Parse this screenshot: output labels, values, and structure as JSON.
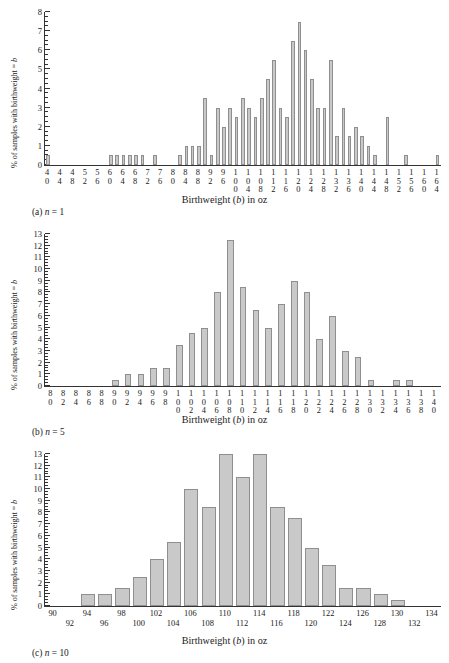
{
  "figure": {
    "axis_y_title_prefix": "% of samples with birthweight = ",
    "axis_y_title_var": "b",
    "axis_x_title_prefix": "Birthweight (",
    "axis_x_title_var": "b",
    "axis_x_title_suffix": ") in oz",
    "bar_fill": "#c9c9c9",
    "bar_stroke": "#8f8f8f",
    "axis_color": "#333333"
  },
  "panels": [
    {
      "id": "a",
      "caption_label": "(a)",
      "caption_var": "n",
      "caption_value": "= 1",
      "caption_full": "(a) n = 1"
    },
    {
      "id": "b",
      "caption_label": "(b)",
      "caption_var": "n",
      "caption_value": "= 5",
      "caption_full": "(b) n = 5"
    },
    {
      "id": "c",
      "caption_label": "(c)",
      "caption_var": "n",
      "caption_value": "= 10",
      "caption_full": "(c) n = 10"
    }
  ],
  "chart_data": [
    {
      "type": "bar",
      "panel": "a",
      "title": "(a) n = 1",
      "xlabel": "Birthweight (b) in oz",
      "ylabel": "% of samples with birthweight = b",
      "ylim": [
        0,
        8
      ],
      "yticks": [
        0,
        1,
        2,
        3,
        4,
        5,
        6,
        7,
        8
      ],
      "ytick_minor_step": 0.25,
      "grid": false,
      "legend": "none",
      "xtick_labels": [
        "40",
        "44",
        "48",
        "52",
        "56",
        "60",
        "64",
        "68",
        "72",
        "76",
        "80",
        "84",
        "88",
        "92",
        "96",
        "100",
        "104",
        "108",
        "112",
        "116",
        "120",
        "124",
        "128",
        "132",
        "136",
        "140",
        "144",
        "148",
        "152",
        "156",
        "160",
        "164"
      ],
      "xtick_every": 2,
      "categories": [
        40,
        42,
        44,
        46,
        48,
        50,
        52,
        54,
        56,
        58,
        60,
        62,
        64,
        66,
        68,
        70,
        72,
        74,
        76,
        78,
        80,
        82,
        84,
        86,
        88,
        90,
        92,
        94,
        96,
        98,
        100,
        102,
        104,
        106,
        108,
        110,
        112,
        114,
        116,
        118,
        120,
        122,
        124,
        126,
        128,
        130,
        132,
        134,
        136,
        138,
        140,
        142,
        144,
        146,
        148,
        150,
        152,
        154,
        156,
        158,
        160,
        162,
        164
      ],
      "values": [
        0.5,
        0,
        0,
        0,
        0,
        0,
        0,
        0,
        0,
        0,
        0.5,
        0.5,
        0.5,
        0.5,
        0.5,
        0.5,
        0,
        0.5,
        0,
        0,
        0,
        0.5,
        1.0,
        1.0,
        1.0,
        3.5,
        0.5,
        3.0,
        2.0,
        3.0,
        2.5,
        3.5,
        3.0,
        2.5,
        3.5,
        4.5,
        5.5,
        3.0,
        2.5,
        6.5,
        7.5,
        6.0,
        4.5,
        3.0,
        3.0,
        5.5,
        1.5,
        3.0,
        1.5,
        2.0,
        1.5,
        1.0,
        0.5,
        0,
        2.5,
        0,
        0,
        0.5,
        0,
        0,
        0,
        0,
        0.5
      ]
    },
    {
      "type": "bar",
      "panel": "b",
      "title": "(b) n = 5",
      "xlabel": "Birthweight (b) in oz",
      "ylabel": "% of samples with birthweight = b",
      "ylim": [
        0,
        13
      ],
      "yticks": [
        0,
        1,
        2,
        3,
        4,
        5,
        6,
        7,
        8,
        9,
        10,
        11,
        12,
        13
      ],
      "ytick_minor_step": 0.25,
      "grid": false,
      "legend": "none",
      "xtick_labels": [
        "80",
        "82",
        "84",
        "86",
        "88",
        "90",
        "92",
        "94",
        "96",
        "98",
        "100",
        "102",
        "104",
        "106",
        "108",
        "110",
        "112",
        "114",
        "116",
        "118",
        "120",
        "122",
        "124",
        "126",
        "128",
        "130",
        "132",
        "134",
        "136",
        "138",
        "140"
      ],
      "categories": [
        80,
        82,
        84,
        86,
        88,
        90,
        92,
        94,
        96,
        98,
        100,
        102,
        104,
        106,
        108,
        110,
        112,
        114,
        116,
        118,
        120,
        122,
        124,
        126,
        128,
        130,
        132,
        134,
        136,
        138,
        140
      ],
      "values": [
        0,
        0,
        0,
        0,
        0,
        0.5,
        1.0,
        1.0,
        1.5,
        1.5,
        3.5,
        4.5,
        5.0,
        8.0,
        12.5,
        8.5,
        6.5,
        5.0,
        7.0,
        9.0,
        8.0,
        4.0,
        6.0,
        3.0,
        2.5,
        0.5,
        0,
        0.5,
        0.5,
        0,
        0
      ]
    },
    {
      "type": "bar",
      "panel": "c",
      "title": "(c) n = 10",
      "xlabel": "Birthweight (b) in oz",
      "ylabel": "% of samples with birthweight = b",
      "ylim": [
        0,
        13
      ],
      "yticks": [
        0,
        1,
        2,
        3,
        4,
        5,
        6,
        7,
        8,
        9,
        10,
        11,
        12,
        13
      ],
      "ytick_minor_step": 0.25,
      "grid": false,
      "legend": "none",
      "xtick_labels": [
        "90",
        "92",
        "94",
        "96",
        "98",
        "100",
        "102",
        "104",
        "106",
        "108",
        "110",
        "112",
        "114",
        "116",
        "118",
        "120",
        "122",
        "124",
        "126",
        "128",
        "130",
        "132",
        "134"
      ],
      "categories": [
        90,
        92,
        94,
        96,
        98,
        100,
        102,
        104,
        106,
        108,
        110,
        112,
        114,
        116,
        118,
        120,
        122,
        124,
        126,
        128,
        130,
        132,
        134
      ],
      "values": [
        0,
        0,
        1.0,
        1.0,
        1.5,
        2.5,
        4.0,
        5.5,
        10.0,
        8.5,
        13.0,
        11.0,
        13.0,
        8.5,
        7.5,
        5.0,
        3.5,
        1.5,
        1.5,
        1.0,
        0.5,
        0,
        0
      ]
    }
  ]
}
